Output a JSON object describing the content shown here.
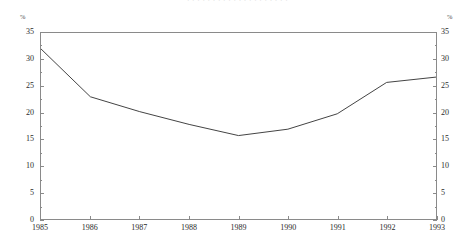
{
  "figure": {
    "title_fragment": "· · · · · · · · · · · · · · · · · · · ·",
    "left_axis_unit": "%",
    "right_axis_unit": "%"
  },
  "chart_data": {
    "type": "line",
    "title": "",
    "xlabel": "",
    "ylabel": "%",
    "y2label": "%",
    "categories": [
      "1985",
      "1986",
      "1987",
      "1988",
      "1989",
      "1990",
      "1991",
      "1992",
      "1993"
    ],
    "x": [
      1985,
      1986,
      1987,
      1988,
      1989,
      1990,
      1991,
      1992,
      1993
    ],
    "values": [
      32.0,
      23.0,
      20.2,
      17.8,
      15.7,
      16.9,
      19.8,
      25.7,
      26.7
    ],
    "series": [
      {
        "name": "",
        "values": [
          32.0,
          23.0,
          20.2,
          17.8,
          15.7,
          16.9,
          19.8,
          25.7,
          26.7
        ]
      }
    ],
    "ylim": [
      0,
      35
    ],
    "y2lim": [
      0,
      35
    ],
    "xlim": [
      1985,
      1993
    ],
    "yticks": [
      0,
      5,
      10,
      15,
      20,
      25,
      30,
      35
    ],
    "ytick_labels": [
      "0",
      "5",
      "10",
      "15",
      "20",
      "25",
      "30",
      "35"
    ],
    "y2ticks": [
      0,
      5,
      10,
      15,
      20,
      25,
      30,
      35
    ],
    "y2tick_labels": [
      "0",
      "5",
      "10",
      "15",
      "20",
      "25",
      "30",
      "35"
    ],
    "y_minor_ticks": [
      2.5,
      7.5,
      12.5,
      17.5,
      22.5,
      27.5,
      32.5
    ],
    "xticks": [
      1985,
      1986,
      1987,
      1988,
      1989,
      1990,
      1991,
      1992,
      1993
    ],
    "xtick_labels": [
      "1985",
      "1986",
      "1987",
      "1988",
      "1989",
      "1990",
      "1991",
      "1992",
      "1993"
    ],
    "grid": false,
    "legend": false,
    "legend_position": "none",
    "line_color": "#444444",
    "line_width": 1,
    "markers": false,
    "frame": "box",
    "annotations": []
  }
}
